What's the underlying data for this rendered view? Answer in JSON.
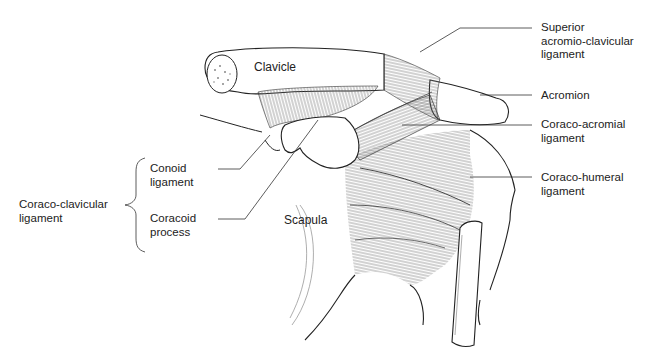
{
  "diagram": {
    "type": "anatomical-illustration",
    "line_color": "#222222",
    "fiber_color": "#555555",
    "background": "#ffffff"
  },
  "labels": {
    "clavicle": {
      "text": "Clavicle"
    },
    "scapula": {
      "text": "Scapula"
    },
    "superior_ac": {
      "line1": "Superior",
      "line2": "acromio-clavicular",
      "line3": "ligament"
    },
    "acromion": {
      "text": "Acromion"
    },
    "coraco_acromial": {
      "line1": "Coraco-acromial",
      "line2": "ligament"
    },
    "coraco_humeral": {
      "line1": "Coraco-humeral",
      "line2": "ligament"
    },
    "conoid": {
      "line1": "Conoid",
      "line2": "ligament"
    },
    "coracoid": {
      "line1": "Coracoid",
      "line2": "process"
    },
    "coraco_clavicular": {
      "line1": "Coraco-clavicular",
      "line2": "ligament"
    }
  }
}
